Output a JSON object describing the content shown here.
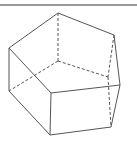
{
  "figure": {
    "colors": {
      "background": "#ffffff",
      "rule": "#9a9a9a",
      "edge": "#555555"
    },
    "vertices": {
      "A": [
        58,
        13
      ],
      "B": [
        114,
        35
      ],
      "C": [
        120,
        85
      ],
      "D": [
        51,
        93
      ],
      "E": [
        9,
        48
      ],
      "E2": [
        9,
        91
      ],
      "D2": [
        50,
        135
      ],
      "C2": [
        111,
        127
      ],
      "F": [
        58,
        61
      ],
      "G": [
        108,
        77
      ]
    },
    "visible_edges": [
      [
        "E",
        "A"
      ],
      [
        "A",
        "B"
      ],
      [
        "B",
        "C"
      ],
      [
        "E",
        "D"
      ],
      [
        "D",
        "C"
      ],
      [
        "E",
        "E2"
      ],
      [
        "D",
        "D2"
      ],
      [
        "C",
        "C2"
      ],
      [
        "E2",
        "D2"
      ],
      [
        "D2",
        "C2"
      ]
    ],
    "hidden_edges": [
      [
        "A",
        "F"
      ],
      [
        "F",
        "E2"
      ],
      [
        "F",
        "G"
      ],
      [
        "B",
        "G"
      ],
      [
        "G",
        "C2"
      ]
    ]
  }
}
